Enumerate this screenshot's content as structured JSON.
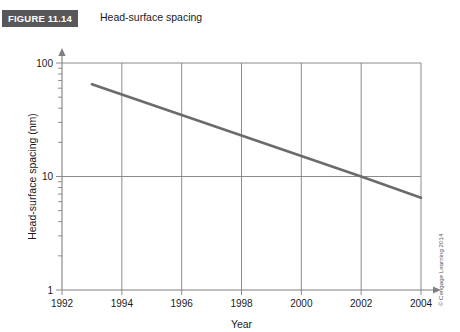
{
  "figure": {
    "banner_label": "FIGURE 11.14",
    "caption": "Head-surface spacing",
    "banner_color": "#58585a",
    "banner_text_color": "#ffffff"
  },
  "credit": {
    "text": "© Cengage Learning 2014"
  },
  "chart_data": {
    "type": "line",
    "title": "Head-surface spacing",
    "xlabel": "Year",
    "ylabel": "Head-surface spacing (nm)",
    "xlim": [
      1992,
      2004
    ],
    "ylim": [
      1,
      100
    ],
    "yscale": "log",
    "grid": true,
    "legend": "none",
    "x_ticks": [
      1992,
      1994,
      1996,
      1998,
      2000,
      2002,
      2004
    ],
    "x_tick_labels": [
      "1992",
      "1994",
      "1996",
      "1998",
      "2000",
      "2002",
      "2004"
    ],
    "y_ticks": [
      1,
      10,
      100
    ],
    "y_tick_labels": [
      "1",
      "10",
      "100"
    ],
    "y_minor_ticks": [
      2,
      3,
      4,
      5,
      6,
      7,
      8,
      9,
      20,
      30,
      40,
      50,
      60,
      70,
      80,
      90
    ],
    "x_gridlines": [
      1994,
      1996,
      1998,
      2000,
      2002,
      2004
    ],
    "y_gridlines": [
      10,
      100
    ],
    "line_color": "#6b6b6b",
    "axis_color": "#808080",
    "series": [
      {
        "name": "Head-surface spacing",
        "x": [
          1993,
          2002,
          2004
        ],
        "values": [
          65,
          10,
          6.5
        ]
      }
    ]
  }
}
